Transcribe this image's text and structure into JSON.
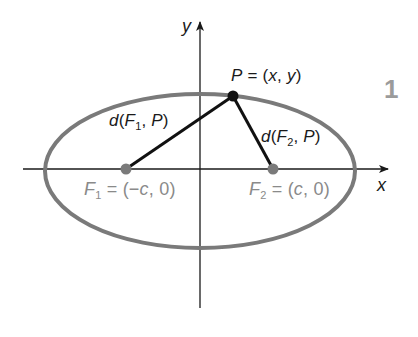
{
  "diagram": {
    "axes": {
      "x_label": "x",
      "y_label": "y"
    },
    "points": {
      "P": {
        "name": "P",
        "eq": " = (",
        "x": "x",
        "sep": ", ",
        "y": "y",
        "close": ")"
      },
      "F1": {
        "name": "F",
        "sub": "1",
        "eq": " = (−",
        "c": "c",
        "rest": ", 0)"
      },
      "F2": {
        "name": "F",
        "sub": "2",
        "eq": " = (",
        "c": "c",
        "rest": ", 0)"
      }
    },
    "distances": {
      "d1": {
        "d": "d",
        "open": "(",
        "F": "F",
        "sub": "1",
        "sep": ", ",
        "P": "P",
        "close": ")"
      },
      "d2": {
        "d": "d",
        "open": "(",
        "F": "F",
        "sub": "2",
        "sep": ", ",
        "P": "P",
        "close": ")"
      }
    },
    "watermark": "1",
    "colors": {
      "ellipse": "#7a7a7a",
      "axes": "#1a1a1a",
      "segments": "#111111",
      "foci": "#7a7a7a",
      "point_P": "#111111",
      "focus_labels": "#8a8a8a"
    }
  }
}
